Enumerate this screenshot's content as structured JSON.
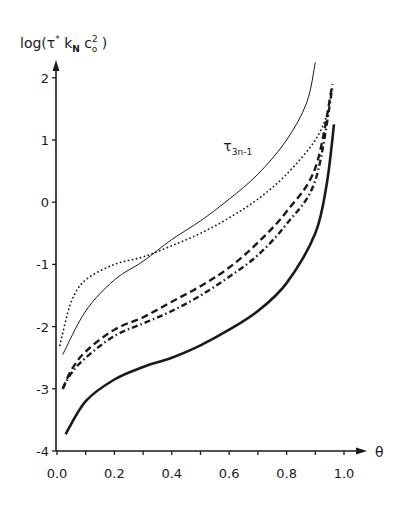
{
  "chart_data": {
    "type": "line",
    "title": "",
    "xlabel": "θ",
    "ylabel": "log(τ* k_N c_o²)",
    "ylabel_parts": {
      "prefix": "log(",
      "tau": "τ",
      "star": "*",
      "k": "k",
      "k_sub": "N",
      "c": "c",
      "c_sub": "o",
      "c_sup": "2",
      "suffix": ")"
    },
    "xlim": [
      0.0,
      1.0
    ],
    "ylim": [
      -4,
      2
    ],
    "x_ticks": [
      "0.0",
      "0.2",
      "0.4",
      "0.6",
      "0.8",
      "1.0"
    ],
    "x_tick_values": [
      0.0,
      0.2,
      0.4,
      0.6,
      0.8,
      1.0
    ],
    "x_minor_ticks": [
      0.1,
      0.3,
      0.5,
      0.7,
      0.9
    ],
    "y_ticks": [
      "2",
      "1",
      "0",
      "-1",
      "-2",
      "-3",
      "-4"
    ],
    "y_tick_values": [
      2,
      1,
      0,
      -1,
      -2,
      -3,
      -4
    ],
    "grid": false,
    "legend": null,
    "annotations": [
      {
        "text": "τ",
        "sub": "3n-1",
        "theta": 0.59,
        "value": 0.95,
        "series": "thin-solid"
      }
    ],
    "series": [
      {
        "name": "τ_3n-1",
        "style": "thin-solid",
        "x": [
          0.02,
          0.1,
          0.2,
          0.3,
          0.4,
          0.5,
          0.6,
          0.7,
          0.8,
          0.87,
          0.9
        ],
        "values": [
          -2.45,
          -1.75,
          -1.25,
          -0.95,
          -0.6,
          -0.3,
          0.05,
          0.45,
          1.0,
          1.6,
          2.25
        ]
      },
      {
        "name": "dotted",
        "style": "dotted",
        "x": [
          0.01,
          0.05,
          0.1,
          0.2,
          0.3,
          0.4,
          0.5,
          0.6,
          0.7,
          0.8,
          0.9,
          0.95
        ],
        "values": [
          -2.3,
          -1.6,
          -1.25,
          -1.0,
          -0.88,
          -0.7,
          -0.5,
          -0.25,
          0.05,
          0.45,
          1.0,
          1.5
        ]
      },
      {
        "name": "dashed",
        "style": "dashed",
        "x": [
          0.02,
          0.05,
          0.1,
          0.2,
          0.3,
          0.4,
          0.5,
          0.6,
          0.7,
          0.8,
          0.9,
          0.96
        ],
        "values": [
          -3.0,
          -2.7,
          -2.4,
          -2.05,
          -1.85,
          -1.6,
          -1.35,
          -1.05,
          -0.65,
          -0.15,
          0.55,
          1.9
        ]
      },
      {
        "name": "dash-dot",
        "style": "dash-dot",
        "x": [
          0.02,
          0.05,
          0.1,
          0.2,
          0.3,
          0.4,
          0.5,
          0.6,
          0.7,
          0.8,
          0.9,
          0.96
        ],
        "values": [
          -3.0,
          -2.75,
          -2.5,
          -2.15,
          -1.95,
          -1.75,
          -1.5,
          -1.2,
          -0.85,
          -0.35,
          0.35,
          1.85
        ]
      },
      {
        "name": "thick-solid",
        "style": "thick-solid",
        "x": [
          0.03,
          0.1,
          0.2,
          0.3,
          0.4,
          0.5,
          0.6,
          0.7,
          0.8,
          0.9,
          0.94,
          0.965
        ],
        "values": [
          -3.73,
          -3.2,
          -2.85,
          -2.65,
          -2.5,
          -2.3,
          -2.05,
          -1.75,
          -1.3,
          -0.5,
          0.3,
          1.25
        ]
      }
    ]
  },
  "colors": {
    "ink": "#1a1a1a",
    "background": "#ffffff"
  }
}
